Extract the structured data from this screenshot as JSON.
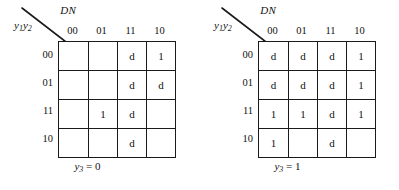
{
  "figure": {
    "type": "karnaugh-map-pair",
    "maps": [
      {
        "id": "kmap-y3-0",
        "corner": {
          "column_vars": "DN",
          "row_vars_main": "y",
          "row_vars_sub1": "1",
          "row_vars_main2": "y",
          "row_vars_sub2": "2"
        },
        "column_headers": [
          "00",
          "01",
          "11",
          "10"
        ],
        "row_headers": [
          "00",
          "01",
          "11",
          "10"
        ],
        "cells": [
          [
            "",
            "",
            "d",
            "1"
          ],
          [
            "",
            "",
            "d",
            "d"
          ],
          [
            "",
            "1",
            "d",
            ""
          ],
          [
            "",
            "",
            "d",
            ""
          ]
        ],
        "caption": {
          "var": "y",
          "sub": "3",
          "eq": "=",
          "value": "0"
        }
      },
      {
        "id": "kmap-y3-1",
        "corner": {
          "column_vars": "DN",
          "row_vars_main": "y",
          "row_vars_sub1": "1",
          "row_vars_main2": "y",
          "row_vars_sub2": "2"
        },
        "column_headers": [
          "00",
          "01",
          "11",
          "10"
        ],
        "row_headers": [
          "00",
          "01",
          "11",
          "10"
        ],
        "cells": [
          [
            "d",
            "d",
            "d",
            "1"
          ],
          [
            "d",
            "d",
            "d",
            "1"
          ],
          [
            "1",
            "1",
            "d",
            "1"
          ],
          [
            "1",
            "",
            "d",
            ""
          ]
        ],
        "caption": {
          "var": "y",
          "sub": "3",
          "eq": "=",
          "value": "1"
        }
      }
    ],
    "colors": {
      "line": "#1a1a1a",
      "text": "#111111",
      "background": "#ffffff"
    }
  }
}
